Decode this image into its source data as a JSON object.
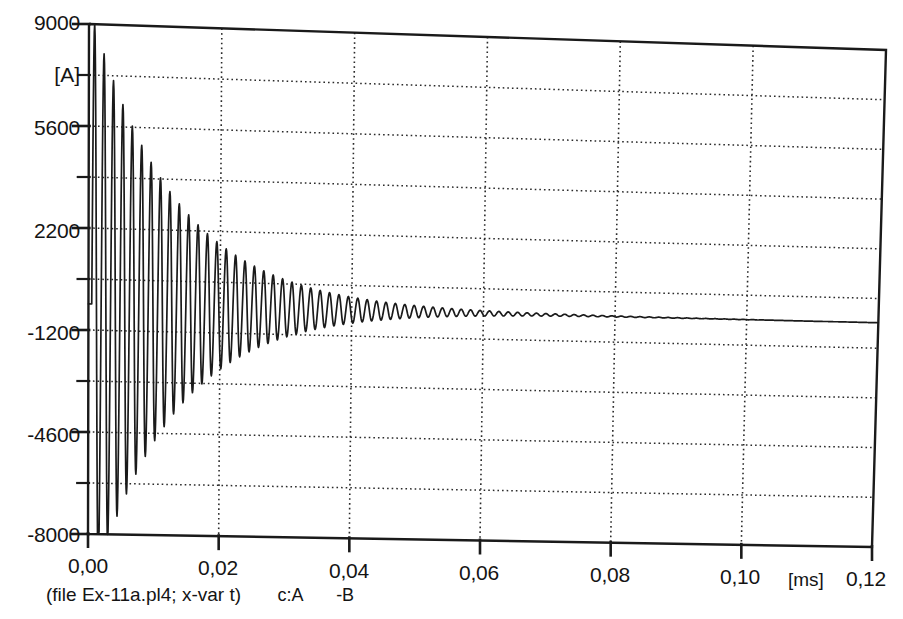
{
  "chart_data": {
    "type": "line",
    "title": "",
    "xlabel": "",
    "ylabel": "",
    "x_unit": "[ms]",
    "y_unit": "[A]",
    "xlim": [
      0.0,
      0.12
    ],
    "ylim": [
      -8000,
      9000
    ],
    "grid": true,
    "grid_style": "dotted",
    "x_ticks": [
      0.0,
      0.02,
      0.04,
      0.06,
      0.08,
      0.1,
      0.12
    ],
    "x_tick_labels": [
      "0,00",
      "0,02",
      "0,04",
      "0,06",
      "0,08",
      "0,10",
      "0,12"
    ],
    "y_ticks": [
      9000,
      7300,
      5600,
      3900,
      2200,
      500,
      -1200,
      -2900,
      -4600,
      -6300,
      -8000
    ],
    "y_tick_labels": [
      "9000",
      "",
      "5600",
      "",
      "2200",
      "",
      "-1200",
      "",
      "-4600",
      "",
      "-8000"
    ],
    "y_labeled_ticks": [
      9000,
      5600,
      2200,
      -1200,
      -4600,
      -8000
    ],
    "caption": "(file Ex-11a.pl4; x-var t)",
    "legend_entries": [
      "c:A",
      "-B"
    ],
    "series": [
      {
        "name": "c:A  -B",
        "description": "damped high-frequency oscillatory inrush current decaying to steady state",
        "color": "#1a1a1a",
        "model": "damped_sine",
        "params": {
          "t_start_ms": 0.0005,
          "t_end_ms": 0.12,
          "period_ms": 0.00143,
          "amplitude_initial_A": 9600,
          "decay_time_constant_ms": 0.0128,
          "steady_state_A": -330,
          "phase_rad": 0.0
        },
        "sampled_points": [
          {
            "t": 0.0005,
            "y": 9600
          },
          {
            "t": 0.0012,
            "y": -7900
          },
          {
            "t": 0.0019,
            "y": 8100
          },
          {
            "t": 0.0026,
            "y": -7100
          },
          {
            "t": 0.0033,
            "y": 7000
          },
          {
            "t": 0.0041,
            "y": -6100
          },
          {
            "t": 0.0048,
            "y": 6000
          },
          {
            "t": 0.0055,
            "y": -5300
          },
          {
            "t": 0.0062,
            "y": 5100
          },
          {
            "t": 0.0069,
            "y": -4500
          },
          {
            "t": 0.0076,
            "y": 4300
          },
          {
            "t": 0.0084,
            "y": -3800
          },
          {
            "t": 0.0091,
            "y": 3600
          },
          {
            "t": 0.0098,
            "y": -3200
          },
          {
            "t": 0.0105,
            "y": 3000
          },
          {
            "t": 0.0112,
            "y": -2600
          },
          {
            "t": 0.012,
            "y": 2400
          },
          {
            "t": 0.0134,
            "y": 1900
          },
          {
            "t": 0.0148,
            "y": 1500
          },
          {
            "t": 0.0163,
            "y": 1150
          },
          {
            "t": 0.0177,
            "y": 880
          },
          {
            "t": 0.0191,
            "y": 640
          },
          {
            "t": 0.022,
            "y": 350
          },
          {
            "t": 0.025,
            "y": 180
          },
          {
            "t": 0.03,
            "y": 40
          },
          {
            "t": 0.04,
            "y": -180
          },
          {
            "t": 0.05,
            "y": -270
          },
          {
            "t": 0.06,
            "y": -310
          },
          {
            "t": 0.08,
            "y": -325
          },
          {
            "t": 0.1,
            "y": -330
          },
          {
            "t": 0.12,
            "y": -330
          }
        ]
      }
    ]
  },
  "axes": {
    "y_labels": [
      "9000",
      "5600",
      "2200",
      "-1200",
      "-4600",
      "-8000"
    ],
    "y_unit": "[A]",
    "x_labels": [
      "0,00",
      "0,02",
      "0,04",
      "0,06",
      "0,08",
      "0,10",
      "0,12"
    ],
    "x_unit": "[ms]"
  },
  "footer": {
    "file_caption": "(file Ex-11a.pl4; x-var t)",
    "series_a": "c:A",
    "series_b": "-B"
  }
}
